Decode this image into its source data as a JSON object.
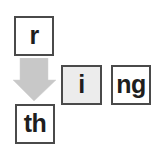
{
  "diagram": {
    "source_tile": {
      "label": "r",
      "shaded": false
    },
    "target_tile": {
      "label": "th",
      "shaded": false
    },
    "word_tiles": [
      {
        "label": "i",
        "shaded": true
      },
      {
        "label": "ng",
        "shaded": false
      }
    ],
    "arrow": {
      "direction": "down",
      "icon": "down-arrow-icon",
      "color": "#c8c8c8"
    }
  },
  "colors": {
    "border": "#4a4a4a",
    "text": "#1e1e1e",
    "shaded_fill": "#ececec",
    "tile_fill": "#ffffff",
    "arrow": "#c8c8c8"
  }
}
